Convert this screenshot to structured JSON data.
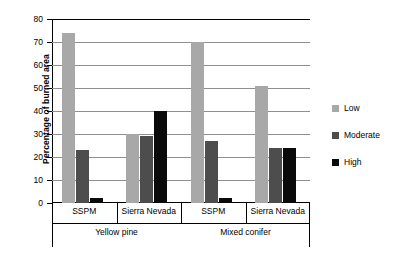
{
  "chart_data": {
    "type": "bar",
    "title": "",
    "xlabel": "",
    "ylabel": "Percentage of burned area",
    "ylim": [
      0,
      80
    ],
    "yticks": [
      0,
      10,
      20,
      30,
      40,
      50,
      60,
      70,
      80
    ],
    "grid": "horizontal",
    "legend_position": "right",
    "categories": [
      "SSPM",
      "Sierra Nevada",
      "SSPM",
      "Sierra Nevada"
    ],
    "groups": [
      {
        "label": "Yellow pine",
        "categories": [
          "SSPM",
          "Sierra Nevada"
        ]
      },
      {
        "label": "Mixed conifer",
        "categories": [
          "SSPM",
          "Sierra Nevada"
        ]
      }
    ],
    "series": [
      {
        "name": "Low",
        "color": "#a8a8a8",
        "values": [
          74,
          30,
          70,
          51
        ]
      },
      {
        "name": "Moderate",
        "color": "#4d4d4d",
        "values": [
          23,
          29,
          27,
          24
        ]
      },
      {
        "name": "High",
        "color": "#0a0a0a",
        "values": [
          2,
          40,
          2,
          24
        ]
      }
    ]
  },
  "axis": {
    "y_title": "Percentage of burned area",
    "y_tick_labels": [
      "80",
      "70",
      "60",
      "50",
      "40",
      "30",
      "20",
      "10",
      "0"
    ]
  },
  "legend": {
    "items": [
      {
        "label": "Low"
      },
      {
        "label": "Moderate"
      },
      {
        "label": "High"
      }
    ]
  },
  "category_axis": {
    "ticks": [
      "SSPM",
      "Sierra Nevada",
      "SSPM",
      "Sierra Nevada"
    ],
    "group_labels": [
      "Yellow pine",
      "Mixed conifer"
    ]
  }
}
